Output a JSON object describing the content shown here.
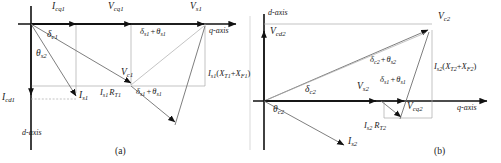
{
  "figure": {
    "type": "phasor-diagram",
    "width": 501,
    "height": 163,
    "background": "#ffffff",
    "line_color": "#9a9a9a",
    "vector_color": "#111111",
    "text_color": "#1a1a1a",
    "captions": {
      "a": "(a)",
      "b": "(b)"
    }
  },
  "panel_a": {
    "axis_labels": {
      "q": "q-axis",
      "d": "d-axis"
    },
    "vectors": [
      {
        "name": "I_cq1",
        "base": "I",
        "sub": "cq1"
      },
      {
        "name": "V_cq1",
        "base": "V",
        "sub": "cq1"
      },
      {
        "name": "V_s1",
        "base": "V",
        "sub": "s1"
      },
      {
        "name": "V_c1",
        "base": "V",
        "sub": "c1"
      },
      {
        "name": "I_s1",
        "base": "I",
        "sub": "s1"
      },
      {
        "name": "I_cd1",
        "base": "I",
        "sub": "cd1"
      }
    ],
    "angles": [
      {
        "name": "delta_c1",
        "text": "δ",
        "sub": "c1"
      },
      {
        "name": "theta_s2",
        "text": "θ",
        "sub": "s2"
      },
      {
        "name": "delta_s1_theta_s1_top",
        "text": "δ₁ + θ₁"
      },
      {
        "name": "delta_s1_theta_s1_mid",
        "text": "δ₁ + θ₁"
      }
    ],
    "expressions": [
      {
        "name": "Is1_RT1",
        "text": "I_s1 R_T1"
      },
      {
        "name": "Is1_XT1_XF1",
        "text": "I_s1(X_T1+X_F1)"
      }
    ]
  },
  "panel_b": {
    "axis_labels": {
      "q": "q-axis",
      "d": "d-axis"
    },
    "vectors": [
      {
        "name": "V_cd2",
        "base": "V",
        "sub": "cd2"
      },
      {
        "name": "V_c2",
        "base": "V",
        "sub": "c2"
      },
      {
        "name": "V_s2",
        "base": "V",
        "sub": "s2"
      },
      {
        "name": "V_cq2",
        "base": "V",
        "sub": "cq2"
      },
      {
        "name": "I_s2",
        "base": "I",
        "sub": "s2"
      }
    ],
    "angles": [
      {
        "name": "delta_c2_theta_s2",
        "text": "δ_c2 + θ_s2"
      },
      {
        "name": "delta_s1_theta_s1",
        "text": "δ_s1 + θ_s1"
      },
      {
        "name": "delta_c2",
        "text": "δ",
        "sub": "c2"
      },
      {
        "name": "theta_c2",
        "text": "θ",
        "sub": "c2"
      }
    ],
    "expressions": [
      {
        "name": "Is2_RT2",
        "text": "I_s2 R_T2"
      },
      {
        "name": "Is2_XT2_XF2",
        "text": "I_s2(X_T2+X_F2)"
      }
    ]
  },
  "text": {
    "q_axis": "q-axis",
    "d_axis": "d-axis",
    "caption_a": "(a)",
    "caption_b": "(b)",
    "I": "I",
    "V": "V",
    "R": "R",
    "X": "X",
    "delta": "δ",
    "theta": "θ",
    "plus": "+",
    "lparen": "(",
    "rparen": ")",
    "sub_cq1": "cq1",
    "sub_cq2": "cq2",
    "sub_cd1": "cd1",
    "sub_cd2": "cd2",
    "sub_s1": "s1",
    "sub_s2": "s2",
    "sub_c1": "c1",
    "sub_c2": "c2",
    "sub_T1": "T1",
    "sub_T2": "T2",
    "sub_F1": "F1",
    "sub_F2": "F2"
  }
}
